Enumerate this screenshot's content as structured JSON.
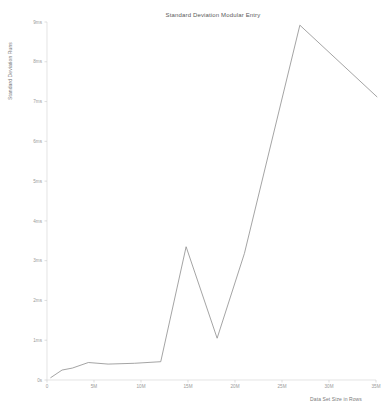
{
  "chart_data": {
    "type": "line",
    "title": "Standard Deviation Modular Entry",
    "xlabel": "Data Set Size in Rows",
    "ylabel": "Standard Deviation Runs",
    "xlim": [
      0,
      35000000
    ],
    "ylim": [
      0,
      9000000
    ],
    "grid": false,
    "legend": null,
    "xticks": [
      0,
      5000000,
      10000000,
      15000000,
      20000000,
      25000000,
      30000000,
      35000000
    ],
    "xticklabels": [
      "0",
      "5M",
      "10M",
      "15M",
      "20M",
      "25M",
      "30M",
      "35M"
    ],
    "yticks": [
      0,
      1000000,
      2000000,
      3000000,
      4000000,
      5000000,
      6000000,
      7000000,
      8000000,
      9000000
    ],
    "yticklabels": [
      "0s",
      "1ms",
      "2ms",
      "3ms",
      "4ms",
      "5ms",
      "6ms",
      "7ms",
      "8ms",
      "9ms"
    ],
    "series": [
      {
        "name": "Standard Deviation Runs",
        "color": "#8d8d8d",
        "x": [
          400000,
          1600000,
          2700000,
          4400000,
          6500000,
          9300000,
          12100000,
          14800000,
          18100000,
          21000000,
          26900000,
          35100000
        ],
        "y": [
          60000,
          250000,
          300000,
          440000,
          400000,
          420000,
          460000,
          3350000,
          1050000,
          3180000,
          8920000,
          7120000
        ]
      }
    ]
  }
}
